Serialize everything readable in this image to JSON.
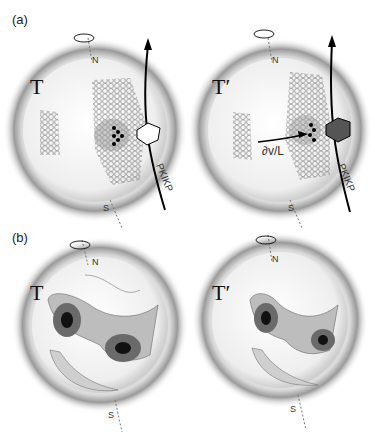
{
  "panels": {
    "a": {
      "label": "(a)",
      "left": {
        "title": "T",
        "north": "N",
        "south": "S",
        "ray": "PKIKP"
      },
      "right": {
        "title": "T′",
        "north": "N",
        "south": "S",
        "ray": "PKIKP",
        "arrow_label": "∂v/L"
      }
    },
    "b": {
      "label": "(b)",
      "left": {
        "title": "T",
        "north": "N",
        "south": "S"
      },
      "right": {
        "title": "T′",
        "north": "N",
        "south": "S"
      }
    }
  },
  "colors": {
    "halo": "#8a8a8a",
    "contour_dark": "#111111",
    "contour_mid": "#6a6a6a",
    "contour_light": "#bdbdbd"
  }
}
